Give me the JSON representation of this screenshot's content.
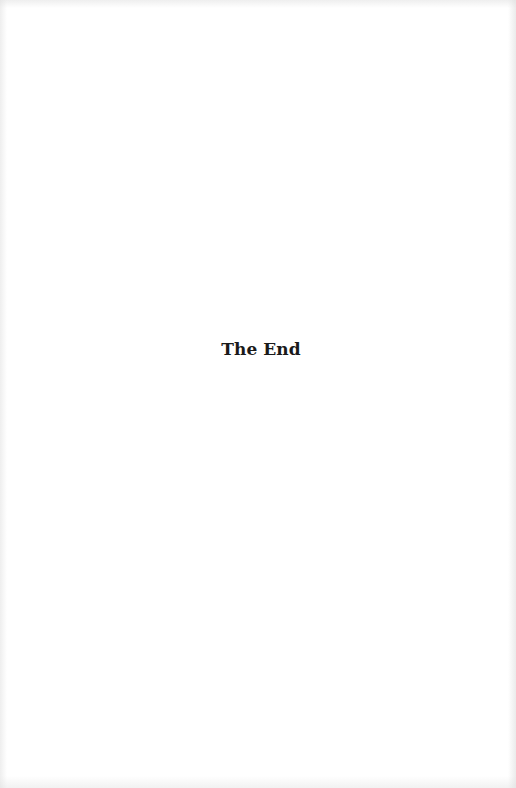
{
  "page": {
    "closing_text": "The End"
  }
}
